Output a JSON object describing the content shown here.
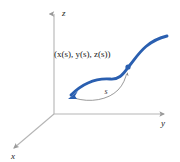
{
  "figure": {
    "title_alt": "Space curve parameterized by arc length in 3D axes",
    "background_color": "#ffffff",
    "axes": {
      "color": "#b0b0b0",
      "labels": {
        "x": "x",
        "y": "y",
        "z": "z"
      },
      "origin": {
        "x": 54,
        "y": 114
      },
      "z_tip": {
        "x": 54,
        "y": 12
      },
      "y_tip": {
        "x": 166,
        "y": 114
      },
      "x_tip": {
        "x": 12,
        "y": 150
      }
    },
    "curve": {
      "color": "#2a5fb0",
      "highlight_color": "#ffffff",
      "width": 3,
      "start_point": {
        "x": 70,
        "y": 95
      },
      "end_point": {
        "x": 167,
        "y": 35
      },
      "marker_point": {
        "x": 128,
        "y": 66
      },
      "start_arrowhead": true
    },
    "point_label": {
      "text": "(x(s), y(s), z(s))",
      "x": 53,
      "y": 57
    },
    "arc": {
      "color": "#8a8a8a",
      "label": "s",
      "label_x": 106,
      "label_y": 94,
      "arrow_target": {
        "x": 127,
        "y": 70
      }
    }
  }
}
